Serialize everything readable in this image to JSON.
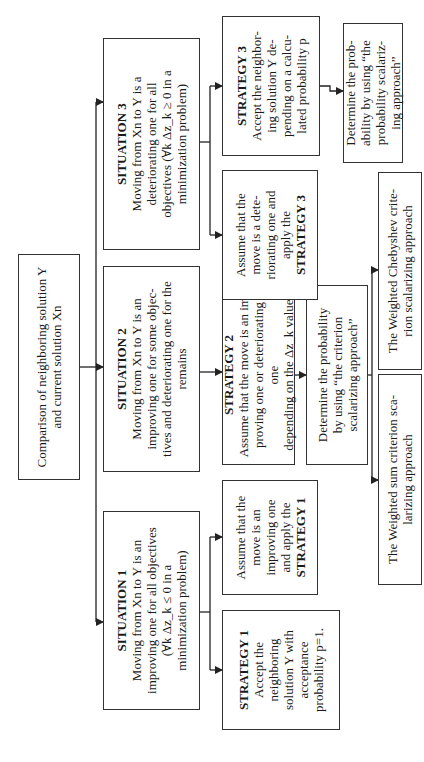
{
  "diagram": {
    "root": {
      "text": "Comparison of neighboring solution Y and current solution Xn"
    },
    "situations": [
      {
        "title": "SITUATION 1",
        "body": "Moving from Xn to Y is an\nimproving one for all objectives\n(∀k Δz_k ≤ 0 in a\nminimization problem)"
      },
      {
        "title": "SITUATION 2",
        "body": "Moving from Xn to Y is an\nimproving one for some objec-\ntives and deteriorating one for the\nremains"
      },
      {
        "title": "SITUATION 3",
        "body": "Moving from Xn to Y is a\ndeteriorating one for all\nobjectives (∀k Δz_k ≥ 0 in a\nminimization problem)"
      }
    ],
    "strategy1": {
      "title": "STRATEGY 1",
      "body": "Accept the\nneighboring\nsolution Y with\nacceptance\nprobability p=1."
    },
    "assume_improving": {
      "body": "Assume that the\nmove is an\nimproving one\nand apply the",
      "strategy_ref": "STRATEGY 1"
    },
    "strategy2": {
      "title": "STRATEGY 2",
      "body": "Assume that the move is an im-\nproving one or deteriorating one\ndepending on the Δz_k value"
    },
    "determine_criterion": {
      "body": "Determine the probability\nby using “the criterion\nscalarizing approach”"
    },
    "weighted_sum": {
      "body": "The Weighted sum criterion sca-\nlarizing approach"
    },
    "weighted_chebyshev": {
      "body": "The Weighted Chebyshev crite-\nrion scalarizing approach"
    },
    "assume_deteriorating": {
      "body": "Assume that the\nmove is a dete-\nriorating one and\napply the",
      "strategy_ref": "STRATEGY 3"
    },
    "strategy3": {
      "title": "STRATEGY 3",
      "body": "Accept the neighbor-\ning solution Y de-\npending on a calcu-\nlated probability p"
    },
    "determine_probability": {
      "body": "Determine the prob-\nability by using “the\nprobability scalariz-\ning approach”"
    },
    "colors": {
      "border": "#333333",
      "text": "#1a1a1a",
      "background": "#ffffff"
    }
  }
}
